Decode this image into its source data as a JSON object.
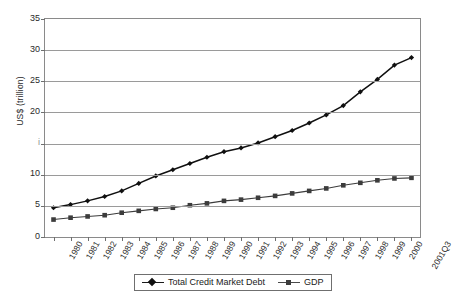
{
  "chart_data": {
    "type": "line",
    "title": "",
    "xlabel": "",
    "ylabel": "US$ (trillion)",
    "ylim": [
      0,
      35
    ],
    "yticks": [
      0,
      5,
      10,
      15,
      20,
      25,
      30,
      35
    ],
    "ytick_labels": [
      "0",
      "5",
      "10",
      "i",
      "20",
      "25",
      "30",
      "35"
    ],
    "grid": true,
    "legend_position": "bottom-center",
    "categories": [
      "1980",
      "1981",
      "1982",
      "1983",
      "1984",
      "1985",
      "1986",
      "1987",
      "1988",
      "1989",
      "1990",
      "1991",
      "1992",
      "1993",
      "1994",
      "1995",
      "1996",
      "1997",
      "1998",
      "1999",
      "2000",
      "2001Q3"
    ],
    "series": [
      {
        "name": "Total Credit Market Debt",
        "marker": "diamond",
        "color": "#101010",
        "values": [
          4.7,
          5.2,
          5.8,
          6.5,
          7.4,
          8.6,
          9.8,
          10.8,
          11.8,
          12.8,
          13.7,
          14.3,
          15.1,
          16.1,
          17.1,
          18.3,
          19.6,
          21.1,
          23.3,
          25.3,
          27.6,
          28.8
        ]
      },
      {
        "name": "GDP",
        "marker": "square",
        "color": "#3c3c3c",
        "values": [
          2.8,
          3.1,
          3.3,
          3.5,
          3.9,
          4.2,
          4.5,
          4.7,
          5.1,
          5.4,
          5.8,
          6.0,
          6.3,
          6.6,
          7.0,
          7.4,
          7.8,
          8.3,
          8.7,
          9.1,
          9.4,
          9.5
        ]
      }
    ]
  }
}
